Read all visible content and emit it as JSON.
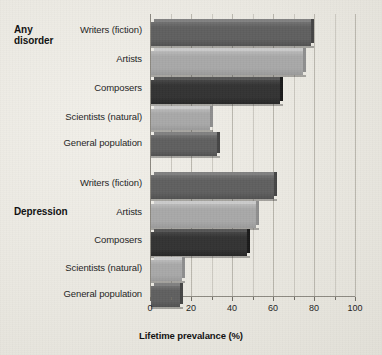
{
  "chart_data": {
    "type": "bar",
    "orientation": "horizontal",
    "title": "",
    "xlabel": "Lifetime prevalance (%)",
    "ylabel": "",
    "xlim": [
      0,
      100
    ],
    "xticks": [
      0,
      20,
      40,
      60,
      80,
      100
    ],
    "xtick_labels": [
      "0",
      "20",
      "40",
      "60",
      "80",
      "100"
    ],
    "minor_tick_step": 10,
    "grid": "vertical",
    "legend": "none",
    "groups": [
      {
        "name": "Any disorder",
        "categories": [
          "Writers (fiction)",
          "Artists",
          "Composers",
          "Scientists (natural)",
          "General population"
        ],
        "values": [
          78,
          74,
          63,
          29,
          32
        ],
        "colors": [
          "#5f5f5f",
          "#a8a8a8",
          "#333333",
          "#a8a8a8",
          "#5f5f5f"
        ]
      },
      {
        "name": "Depression",
        "categories": [
          "Writers (fiction)",
          "Artists",
          "Composers",
          "Scientists (natural)",
          "General population"
        ],
        "values": [
          60,
          51,
          47,
          15,
          14
        ],
        "colors": [
          "#5f5f5f",
          "#a8a8a8",
          "#333333",
          "#a8a8a8",
          "#5f5f5f"
        ]
      }
    ]
  },
  "axis": {
    "x_title": "Lifetime prevalance (%)",
    "ticks": [
      "0",
      "20",
      "40",
      "60",
      "80",
      "100"
    ]
  },
  "groups": {
    "any_disorder": {
      "label_line1": "Any",
      "label_line2": "disorder",
      "rows": [
        {
          "label": "Writers (fiction)",
          "value": 78
        },
        {
          "label": "Artists",
          "value": 74
        },
        {
          "label": "Composers",
          "value": 63
        },
        {
          "label": "Scientists (natural)",
          "value": 29
        },
        {
          "label": "General population",
          "value": 32
        }
      ]
    },
    "depression": {
      "label": "Depression",
      "rows": [
        {
          "label": "Writers (fiction)",
          "value": 60
        },
        {
          "label": "Artists",
          "value": 51
        },
        {
          "label": "Composers",
          "value": 47
        },
        {
          "label": "Scientists (natural)",
          "value": 15
        },
        {
          "label": "General population",
          "value": 14
        }
      ]
    }
  },
  "colors": {
    "series_dark": "#333333",
    "series_mid": "#5f5f5f",
    "series_light": "#a8a8a8",
    "background": "#eceae4",
    "gridline": "#b9b6ad",
    "text": "#1d1d1d"
  }
}
